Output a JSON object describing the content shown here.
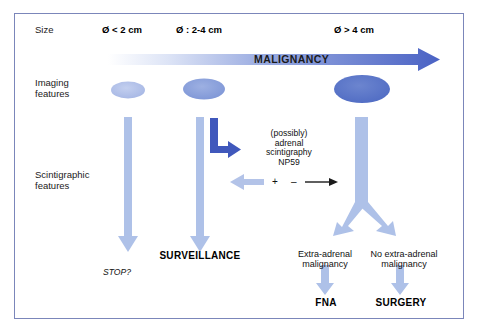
{
  "figure": {
    "type": "clinical-decision-flowchart",
    "border_color": "#7b86ba",
    "background": "#ffffff"
  },
  "rows": {
    "size_label": "Size",
    "imaging_label": "Imaging\nfeatures",
    "scintigraphic_label": "Scintigraphic\nfeatures"
  },
  "sizes": [
    {
      "label": "Ø < 2 cm"
    },
    {
      "label": "Ø : 2-4 cm"
    },
    {
      "label": "Ø > 4 cm"
    }
  ],
  "malignancy_arrow": {
    "label": "MALIGNANCY",
    "gradient_from": "#ffffff",
    "gradient_to": "#4a62c4"
  },
  "imaging_ellipses": [
    {
      "fill": "#adbce8"
    },
    {
      "fill": "#8b9fdc"
    },
    {
      "fill": "#5d76c9"
    }
  ],
  "scintigraphy": {
    "note": "(possibly)\nadrenal\nscintigraphy\nNP59",
    "positive_sign": "+",
    "negative_sign": "–",
    "elbow_arrow_color": "#4058bc",
    "positive_arrow_color": "#b3c3e8",
    "negative_arrow_color": "#1a1a1a"
  },
  "outcomes": {
    "surveillance": "SURVEILLANCE",
    "stop": "STOP?",
    "extra_adrenal": "Extra-adrenal\nmalignancy",
    "no_extra_adrenal": "No extra-adrenal\nmalignancy",
    "fna": "FNA",
    "surgery": "SURGERY"
  },
  "arrow_color": "#aec1e8"
}
